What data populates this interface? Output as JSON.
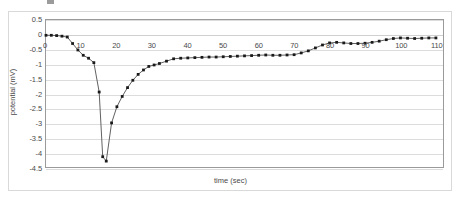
{
  "figure": {
    "background": "#ffffff",
    "frame_color": "#d9d9d9",
    "plot_border_color": "#9a9a9a",
    "gridline_color": "#dcdcdc",
    "series_color": "#4d4d4d",
    "marker_color": "#1a1a1a"
  },
  "chart_data": {
    "type": "line",
    "title": "",
    "subtitle": "",
    "xlabel": "time (sec)",
    "ylabel": "potential (mV)",
    "xlim": [
      0,
      112
    ],
    "ylim": [
      -4.5,
      0.5
    ],
    "xticks": [
      0,
      10,
      20,
      30,
      40,
      50,
      60,
      70,
      80,
      90,
      100,
      110
    ],
    "yticks": [
      0.5,
      0,
      -0.5,
      -1,
      -1.5,
      -2,
      -2.5,
      -3,
      -3.5,
      -4,
      -4.5
    ],
    "ytick_labels": [
      "0.5",
      "0",
      "-0.5",
      "-1",
      "-1.5",
      "-2",
      "-2.5",
      "-3",
      "-3.5",
      "-4",
      "-4.5"
    ],
    "xtick_labels": [
      "0",
      "10",
      "20",
      "30",
      "40",
      "50",
      "60",
      "70",
      "80",
      "90",
      "100",
      "110"
    ],
    "grid": "horizontal",
    "legend": "none",
    "markers": "square",
    "series": [
      {
        "name": "potential",
        "x": [
          0,
          1.5,
          3,
          4.5,
          6,
          7.5,
          9,
          10.5,
          12,
          13.5,
          15,
          16,
          17,
          18.5,
          20,
          21.5,
          23,
          24.5,
          26,
          27.5,
          29,
          30.5,
          32,
          34,
          36,
          38,
          40,
          42,
          44,
          46,
          48,
          50,
          52,
          54,
          56,
          58,
          60,
          62,
          64,
          66,
          68,
          70,
          72,
          74,
          76,
          78,
          80,
          82,
          84,
          86,
          88,
          90,
          92,
          94,
          96,
          98,
          100,
          102,
          104,
          106,
          108,
          110
        ],
        "y": [
          -0.02,
          -0.02,
          -0.03,
          -0.05,
          -0.08,
          -0.3,
          -0.52,
          -0.7,
          -0.8,
          -0.95,
          -1.95,
          -4.15,
          -4.3,
          -3.0,
          -2.45,
          -2.1,
          -1.8,
          -1.55,
          -1.35,
          -1.2,
          -1.08,
          -1.03,
          -0.98,
          -0.9,
          -0.82,
          -0.8,
          -0.79,
          -0.78,
          -0.77,
          -0.76,
          -0.76,
          -0.75,
          -0.74,
          -0.73,
          -0.72,
          -0.71,
          -0.7,
          -0.69,
          -0.7,
          -0.7,
          -0.69,
          -0.68,
          -0.62,
          -0.55,
          -0.45,
          -0.35,
          -0.28,
          -0.26,
          -0.28,
          -0.3,
          -0.3,
          -0.29,
          -0.26,
          -0.22,
          -0.17,
          -0.13,
          -0.11,
          -0.12,
          -0.13,
          -0.12,
          -0.11,
          -0.11
        ]
      }
    ]
  }
}
